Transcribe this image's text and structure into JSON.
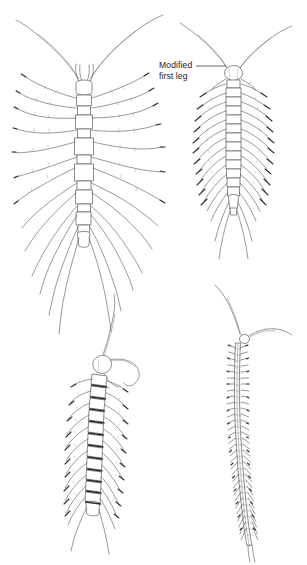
{
  "figure": {
    "kind": "scientific-line-illustration",
    "background_color": "#ffffff",
    "ink_color": "#4a4a4a",
    "label_color": "#1a1a1a",
    "width": 307,
    "height": 565
  },
  "annotations": [
    {
      "id": "modified-first-leg",
      "line1": "Modified",
      "line2": "first leg",
      "x": 159,
      "y": 60,
      "leader": {
        "from_x": 196,
        "from_y": 66,
        "to_x": 226,
        "to_y": 66
      },
      "points_to": "specimen-top-right"
    }
  ],
  "specimens": [
    {
      "id": "specimen-top-left",
      "position": "top-left",
      "description": "Large centipede with very long sweeping legs and long antennae",
      "center_x": 84,
      "body_top": 74,
      "body_bottom": 248,
      "segment_count": 15,
      "leg_pairs": 15,
      "antenna_count": 2,
      "has_forcipules": true,
      "long_terminal_legs": true
    },
    {
      "id": "specimen-top-right",
      "position": "top-right",
      "description": "Centipede with rounded head, modified first leg pair and long trailing terminal legs",
      "center_x": 233,
      "body_top": 66,
      "body_bottom": 218,
      "segment_count": 16,
      "leg_pairs": 16,
      "antenna_count": 2,
      "has_forcipules": true,
      "long_terminal_legs": true
    },
    {
      "id": "specimen-bottom-left",
      "position": "bottom-left",
      "description": "Stout segmented centipede with curled antennae and banded tergites",
      "center_x": 98,
      "body_top": 348,
      "body_bottom": 520,
      "segment_count": 18,
      "leg_pairs": 18,
      "antenna_count": 2,
      "has_forcipules": true,
      "long_terminal_legs": true
    },
    {
      "id": "specimen-bottom-right",
      "position": "bottom-right",
      "description": "Slender elongate soil centipede with very many short legs",
      "center_x": 243,
      "body_top": 334,
      "body_bottom": 545,
      "segment_count": 56,
      "leg_pairs": 56,
      "antenna_count": 2,
      "has_forcipules": false,
      "long_terminal_legs": false
    }
  ]
}
